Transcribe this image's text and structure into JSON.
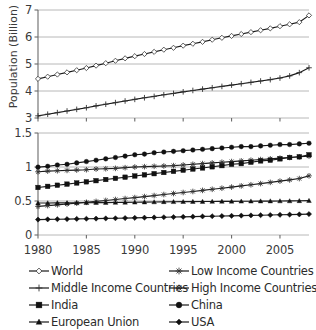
{
  "chart_data": [
    {
      "type": "line",
      "panel": "top",
      "title": "",
      "xlabel": "",
      "ylabel": "Population (Billion)",
      "xlim": [
        1980,
        2008
      ],
      "ylim": [
        3,
        7
      ],
      "yticks": [
        "3",
        "4",
        "5",
        "6",
        "7"
      ],
      "xticks": [
        "1980",
        "1985",
        "1990",
        "1995",
        "2000",
        "2005"
      ],
      "grid": true,
      "legend_position": "below-figure",
      "x": [
        1980,
        1981,
        1982,
        1983,
        1984,
        1985,
        1986,
        1987,
        1988,
        1989,
        1990,
        1991,
        1992,
        1993,
        1994,
        1995,
        1996,
        1997,
        1998,
        1999,
        2000,
        2001,
        2002,
        2003,
        2004,
        2005,
        2006,
        2007,
        2008
      ],
      "series": [
        {
          "name": "World",
          "marker": "open-diamond",
          "values": [
            4.45,
            4.53,
            4.61,
            4.69,
            4.77,
            4.85,
            4.94,
            5.03,
            5.12,
            5.21,
            5.29,
            5.37,
            5.45,
            5.53,
            5.6,
            5.68,
            5.75,
            5.82,
            5.9,
            5.97,
            6.04,
            6.11,
            6.18,
            6.25,
            6.32,
            6.4,
            6.47,
            6.55,
            6.8
          ]
        },
        {
          "name": "Middle Income Countries",
          "marker": "plus",
          "values": [
            3.08,
            3.14,
            3.2,
            3.26,
            3.32,
            3.38,
            3.45,
            3.51,
            3.57,
            3.63,
            3.69,
            3.75,
            3.8,
            3.86,
            3.91,
            3.97,
            4.02,
            4.07,
            4.12,
            4.17,
            4.22,
            4.27,
            4.32,
            4.37,
            4.42,
            4.48,
            4.56,
            4.68,
            4.86
          ]
        }
      ]
    },
    {
      "type": "line",
      "panel": "bottom",
      "title": "",
      "xlabel": "",
      "ylabel": "",
      "xlim": [
        1980,
        2008
      ],
      "ylim": [
        0,
        1.5
      ],
      "yticks": [
        "0",
        "0.5",
        "1",
        "1.5"
      ],
      "xticks": [
        "1980",
        "1985",
        "1990",
        "1995",
        "2000",
        "2005"
      ],
      "grid": true,
      "legend_position": "below-figure",
      "x": [
        1980,
        1981,
        1982,
        1983,
        1984,
        1985,
        1986,
        1987,
        1988,
        1989,
        1990,
        1991,
        1992,
        1993,
        1994,
        1995,
        1996,
        1997,
        1998,
        1999,
        2000,
        2001,
        2002,
        2003,
        2004,
        2005,
        2006,
        2007,
        2008
      ],
      "series": [
        {
          "name": "China",
          "marker": "filled-circle",
          "values": [
            0.998,
            1.01,
            1.03,
            1.04,
            1.06,
            1.08,
            1.1,
            1.12,
            1.14,
            1.16,
            1.18,
            1.19,
            1.21,
            1.22,
            1.23,
            1.24,
            1.25,
            1.26,
            1.27,
            1.28,
            1.29,
            1.3,
            1.3,
            1.31,
            1.32,
            1.33,
            1.33,
            1.34,
            1.35
          ]
        },
        {
          "name": "High Income Countries",
          "marker": "asterisk",
          "values": [
            0.93,
            0.94,
            0.945,
            0.95,
            0.955,
            0.96,
            0.97,
            0.975,
            0.98,
            0.99,
            1.0,
            1.005,
            1.01,
            1.015,
            1.02,
            1.03,
            1.04,
            1.05,
            1.06,
            1.07,
            1.08,
            1.09,
            1.1,
            1.11,
            1.12,
            1.13,
            1.14,
            1.15,
            1.16
          ]
        },
        {
          "name": "India",
          "marker": "filled-square",
          "values": [
            0.699,
            0.715,
            0.732,
            0.748,
            0.765,
            0.782,
            0.799,
            0.816,
            0.833,
            0.85,
            0.868,
            0.885,
            0.902,
            0.919,
            0.936,
            0.953,
            0.97,
            0.986,
            1.003,
            1.02,
            1.04,
            1.05,
            1.07,
            1.09,
            1.1,
            1.12,
            1.14,
            1.15,
            1.18
          ]
        },
        {
          "name": "Low Income Countries",
          "marker": "star",
          "values": [
            0.42,
            0.432,
            0.444,
            0.456,
            0.468,
            0.481,
            0.494,
            0.508,
            0.522,
            0.536,
            0.55,
            0.565,
            0.58,
            0.595,
            0.61,
            0.625,
            0.64,
            0.656,
            0.672,
            0.688,
            0.705,
            0.722,
            0.739,
            0.756,
            0.774,
            0.792,
            0.81,
            0.83,
            0.87
          ]
        },
        {
          "name": "European Union",
          "marker": "filled-triangle",
          "values": [
            0.47,
            0.471,
            0.472,
            0.473,
            0.474,
            0.475,
            0.476,
            0.477,
            0.478,
            0.48,
            0.482,
            0.484,
            0.486,
            0.488,
            0.489,
            0.49,
            0.491,
            0.492,
            0.493,
            0.494,
            0.495,
            0.496,
            0.497,
            0.498,
            0.499,
            0.5,
            0.501,
            0.503,
            0.505
          ]
        },
        {
          "name": "USA",
          "marker": "filled-diamond",
          "values": [
            0.227,
            0.23,
            0.232,
            0.234,
            0.237,
            0.239,
            0.241,
            0.244,
            0.246,
            0.249,
            0.252,
            0.255,
            0.258,
            0.261,
            0.264,
            0.267,
            0.27,
            0.273,
            0.276,
            0.279,
            0.282,
            0.285,
            0.288,
            0.291,
            0.294,
            0.297,
            0.3,
            0.303,
            0.308
          ]
        }
      ]
    }
  ],
  "axes": {
    "top": {
      "ylabel": "Population (Billion)",
      "yticks": [
        "7",
        "6",
        "5",
        "4",
        "3"
      ]
    },
    "bottom": {
      "yticks": [
        "1.5",
        "1",
        "0.5",
        "0"
      ]
    },
    "xticks": [
      "1980",
      "1985",
      "1990",
      "1995",
      "2000",
      "2005"
    ]
  },
  "legend": {
    "left": [
      {
        "label": "World",
        "marker": "open-diamond"
      },
      {
        "label": "Middle Income Countries",
        "marker": "plus"
      },
      {
        "label": "India",
        "marker": "filled-square"
      },
      {
        "label": "European Union",
        "marker": "filled-triangle"
      }
    ],
    "right": [
      {
        "label": "Low Income Countries",
        "marker": "star"
      },
      {
        "label": "High Income Countries",
        "marker": "asterisk"
      },
      {
        "label": "China",
        "marker": "filled-circle"
      },
      {
        "label": "USA",
        "marker": "filled-diamond"
      }
    ]
  },
  "colors": {
    "line": "#1a1a1a",
    "grid": "#b0b0b0",
    "axis": "#6b6b6b",
    "text": "#2b2b2b"
  }
}
